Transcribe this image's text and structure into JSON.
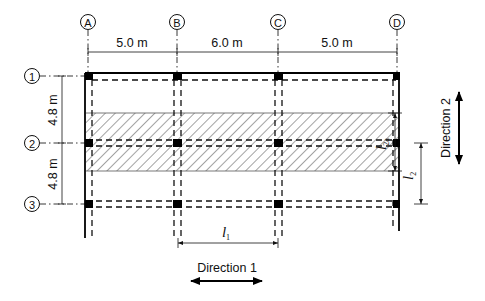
{
  "diagram": {
    "type": "structural-floor-plan",
    "grid_columns": [
      {
        "id": "A",
        "label": "A"
      },
      {
        "id": "B",
        "label": "B"
      },
      {
        "id": "C",
        "label": "C"
      },
      {
        "id": "D",
        "label": "D"
      }
    ],
    "grid_rows": [
      {
        "id": "1",
        "label": "1"
      },
      {
        "id": "2",
        "label": "2"
      },
      {
        "id": "3",
        "label": "3"
      }
    ],
    "spans_direction_1": [
      {
        "from": "A",
        "to": "B",
        "label": "5.0 m"
      },
      {
        "from": "B",
        "to": "C",
        "label": "6.0 m"
      },
      {
        "from": "C",
        "to": "D",
        "label": "5.0 m"
      }
    ],
    "spans_direction_2": [
      {
        "from": "1",
        "to": "2",
        "label": "4.8 m"
      },
      {
        "from": "2",
        "to": "3",
        "label": "4.8 m"
      }
    ],
    "dimensions": {
      "l1": {
        "symbol": "l",
        "subscript": "1"
      },
      "l2a": {
        "symbol": "l",
        "subscript": "2a"
      },
      "l2": {
        "symbol": "l",
        "subscript": "2"
      }
    },
    "directions": {
      "direction_1": "Direction 1",
      "direction_2": "Direction 2"
    },
    "hatched_strip": "design strip along grid line 2"
  }
}
